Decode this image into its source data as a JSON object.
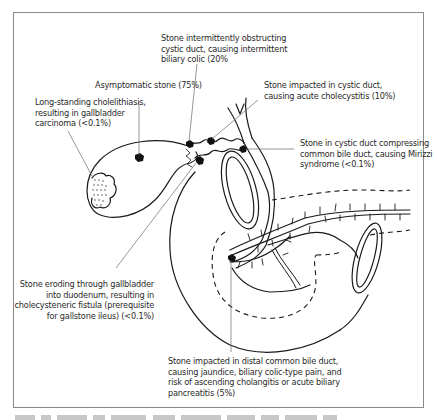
{
  "diagram": {
    "labels": {
      "intermittent": {
        "line1": "Stone intermittently obstructing",
        "line2": "cystic duct, causing intermittent",
        "line3": "biliary colic (20%"
      },
      "asymptomatic": {
        "line1": "Asymptomatic stone (75%)"
      },
      "cholecystitis": {
        "line1": "Stone impacted in cystic duct,",
        "line2": "causing acute cholecystitis (10%)"
      },
      "carcinoma": {
        "line1": "Long-standing cholelithiasis,",
        "line2": "resulting in gallbladder",
        "line3": "carcinoma (<0.1%)"
      },
      "mirizzi": {
        "line1": "Stone in cystic duct compressing",
        "line2": "common bile duct, causing Mirizzi",
        "line3": "syndrome (<0.1%)"
      },
      "fistula": {
        "line1": "Stone eroding through gallbladder",
        "line2": "into duodenum, resulting in",
        "line3": "cholecysteneric fistula (prerequisite",
        "line4": "for gallstone ileus) (<0.1%)"
      },
      "distal_cbd": {
        "line1": "Stone impacted in distal common bile duct,",
        "line2": "causing jaundice, biliary colic-type pain, and",
        "line3": "risk of ascending cholangitis or acute biliary",
        "line4": "pancreatitis (5%)"
      }
    },
    "colors": {
      "ink": "#1a1a1a",
      "leader": "#6a6a6a",
      "frame": "#8a8a8a",
      "background": "#ffffff"
    }
  }
}
